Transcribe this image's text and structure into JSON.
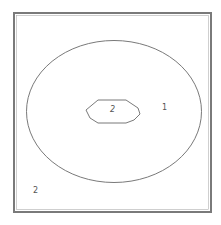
{
  "diagram": {
    "type": "region-contour",
    "colors": {
      "background": "#ffffff",
      "line": "#6a6a6a",
      "frame": "#7a7a7a"
    },
    "regions": [
      {
        "id": "outer",
        "label": "2",
        "position": "bottom-left"
      },
      {
        "id": "ring",
        "label": "1",
        "position": "right-inside-ellipse"
      },
      {
        "id": "inner",
        "label": "2",
        "position": "center-hexagon"
      }
    ]
  }
}
